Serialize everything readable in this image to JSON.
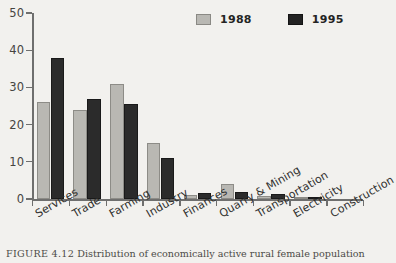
{
  "chart_data": {
    "type": "bar",
    "title": "",
    "xlabel": "",
    "ylabel": "",
    "ylim": [
      0,
      50
    ],
    "yticks": [
      0,
      10,
      20,
      30,
      40,
      50
    ],
    "grid": false,
    "legend_position": "top-right",
    "categories": [
      "Services",
      "Trade",
      "Farming",
      "Industry",
      "Finances",
      "Quarry & Mining",
      "Transportation",
      "Electricity",
      "Construction"
    ],
    "series": [
      {
        "name": "1988",
        "color": "#b9b8b3",
        "values": [
          26,
          24,
          31,
          15,
          1.2,
          4,
          0.8,
          0.2,
          0
        ]
      },
      {
        "name": "1995",
        "color": "#232323",
        "values": [
          38,
          27,
          25.5,
          11,
          1.7,
          2,
          1.4,
          0.3,
          0
        ]
      }
    ]
  },
  "legend": {
    "items": [
      {
        "label": "1988",
        "color": "#b9b8b3"
      },
      {
        "label": "1995",
        "color": "#232323"
      }
    ]
  },
  "caption": {
    "figure_number": "FIGURE 4.12",
    "text": "Distribution of economically active rural female population"
  }
}
